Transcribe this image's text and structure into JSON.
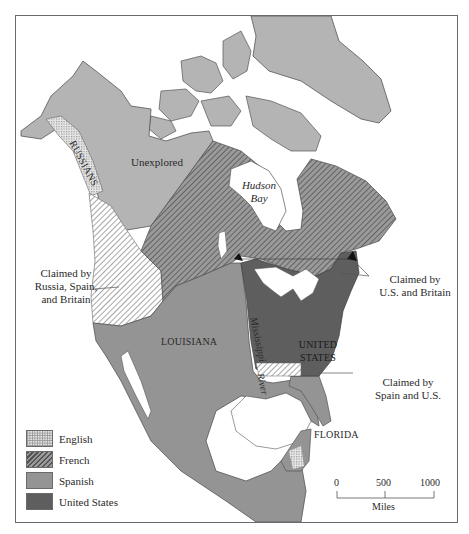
{
  "map": {
    "subject": "North America territorial claims",
    "colors": {
      "english_base": "#d4d4d4",
      "french_base": "#8a8a8a",
      "spanish": "#949494",
      "united_states": "#5e5e5e",
      "unexplored": "#b4b4b4",
      "water": "#ffffff",
      "frame": "#6a6a6a",
      "text": "#2a2a2a"
    },
    "region_labels": {
      "russians": "RUSSIANS",
      "unexplored": "Unexplored",
      "hudson_bay_line1": "Hudson",
      "hudson_bay_line2": "Bay",
      "louisiana": "LOUISIANA",
      "mississippi_river_line1": "Mississippi",
      "mississippi_river_line2": "River",
      "united_states_line1": "UNITED",
      "united_states_line2": "STATES",
      "florida": "FLORIDA"
    },
    "callouts": {
      "russia_spain_britain": [
        "Claimed by",
        "Russia, Spain,",
        "and Britain"
      ],
      "us_britain": [
        "Claimed by",
        "U.S. and Britain"
      ],
      "spain_us": [
        "Claimed by",
        "Spain and U.S."
      ]
    },
    "legend": [
      {
        "label": "English",
        "pattern": "dotted-grid"
      },
      {
        "label": "French",
        "pattern": "diagonal-hatch"
      },
      {
        "label": "Spanish",
        "pattern": "solid-medium-gray"
      },
      {
        "label": "United States",
        "pattern": "solid-dark-gray"
      }
    ],
    "scale_bar": {
      "ticks": [
        "0",
        "500",
        "1000"
      ],
      "unit": "Miles"
    }
  }
}
